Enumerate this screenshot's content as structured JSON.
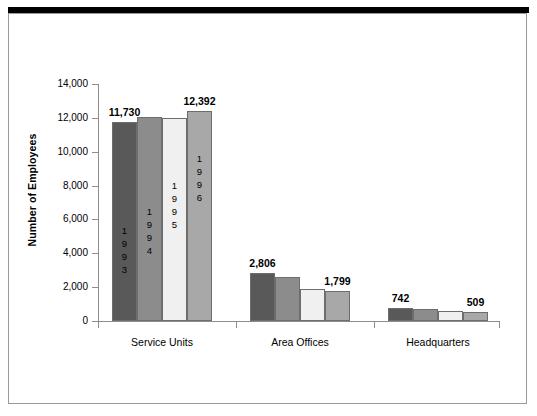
{
  "chart_data": {
    "type": "bar",
    "title": "",
    "xlabel": "",
    "ylabel": "Number of Employees",
    "ylim": [
      0,
      14000
    ],
    "ytick_labels": [
      "14,000",
      "12,000",
      "10,000",
      "8,000",
      "6,000",
      "4,000",
      "2,000",
      "0"
    ],
    "ytick_values": [
      14000,
      12000,
      10000,
      8000,
      6000,
      4000,
      2000,
      0
    ],
    "grid": false,
    "legend": "none",
    "legend_note": "series identified by vertical year text printed inside the first group's bars",
    "categories": [
      "Service Units",
      "Area Offices",
      "Headquarters"
    ],
    "series": [
      {
        "name": "1993",
        "color": "#595959",
        "values": [
          11730,
          2806,
          742
        ]
      },
      {
        "name": "1994",
        "color": "#8c8c8c",
        "values": [
          12050,
          2620,
          690
        ]
      },
      {
        "name": "1995",
        "color": "#f0f0f0",
        "values": [
          12000,
          1880,
          600
        ]
      },
      {
        "name": "1996",
        "color": "#a8a8a8",
        "values": [
          12392,
          1799,
          509
        ]
      }
    ],
    "data_labels": [
      {
        "text": "11,730",
        "series": "1993",
        "category": "Service Units"
      },
      {
        "text": "12,392",
        "series": "1996",
        "category": "Service Units"
      },
      {
        "text": "2,806",
        "series": "1993",
        "category": "Area Offices"
      },
      {
        "text": "1,799",
        "series": "1996",
        "category": "Area Offices"
      },
      {
        "text": "742",
        "series": "1993",
        "category": "Headquarters"
      },
      {
        "text": "509",
        "series": "1996",
        "category": "Headquarters"
      }
    ]
  },
  "axis": {
    "y_title": "Number of Employees",
    "ticks": [
      {
        "label": "14,000"
      },
      {
        "label": "12,000"
      },
      {
        "label": "10,000"
      },
      {
        "label": "8,000"
      },
      {
        "label": "6,000"
      },
      {
        "label": "4,000"
      },
      {
        "label": "2,000"
      },
      {
        "label": "0"
      }
    ]
  },
  "groups": [
    {
      "name": "Service Units",
      "label": "Service Units",
      "bars": [
        {
          "year": "1993",
          "value": 11730,
          "label": "11,730",
          "digits": [
            "1",
            "9",
            "9",
            "3"
          ],
          "show_year": true,
          "show_label": true
        },
        {
          "year": "1994",
          "value": 12050,
          "label": "",
          "digits": [
            "1",
            "9",
            "9",
            "4"
          ],
          "show_year": true,
          "show_label": false
        },
        {
          "year": "1995",
          "value": 12000,
          "label": "",
          "digits": [
            "1",
            "9",
            "9",
            "5"
          ],
          "show_year": true,
          "show_label": false
        },
        {
          "year": "1996",
          "value": 12392,
          "label": "12,392",
          "digits": [
            "1",
            "9",
            "9",
            "6"
          ],
          "show_year": true,
          "show_label": true
        }
      ]
    },
    {
      "name": "Area Offices",
      "label": "Area Offices",
      "bars": [
        {
          "year": "1993",
          "value": 2806,
          "label": "2,806",
          "digits": [],
          "show_year": false,
          "show_label": true
        },
        {
          "year": "1994",
          "value": 2620,
          "label": "",
          "digits": [],
          "show_year": false,
          "show_label": false
        },
        {
          "year": "1995",
          "value": 1880,
          "label": "",
          "digits": [],
          "show_year": false,
          "show_label": false
        },
        {
          "year": "1996",
          "value": 1799,
          "label": "1,799",
          "digits": [],
          "show_year": false,
          "show_label": true
        }
      ]
    },
    {
      "name": "Headquarters",
      "label": "Headquarters",
      "bars": [
        {
          "year": "1993",
          "value": 742,
          "label": "742",
          "digits": [],
          "show_year": false,
          "show_label": true
        },
        {
          "year": "1994",
          "value": 690,
          "label": "",
          "digits": [],
          "show_year": false,
          "show_label": false
        },
        {
          "year": "1995",
          "value": 600,
          "label": "",
          "digits": [],
          "show_year": false,
          "show_label": false
        },
        {
          "year": "1996",
          "value": 509,
          "label": "509",
          "digits": [],
          "show_year": false,
          "show_label": true
        }
      ]
    }
  ],
  "colors": {
    "series_1993": "#595959",
    "series_1994": "#8c8c8c",
    "series_1995": "#f0f0f0",
    "series_1996": "#a8a8a8",
    "bar_outline": "#6d6d6d",
    "axis": "#8d8d8d",
    "frame": "#9a9a9a",
    "top_rule": "#000000",
    "background": "#ffffff",
    "text": "#000000"
  }
}
